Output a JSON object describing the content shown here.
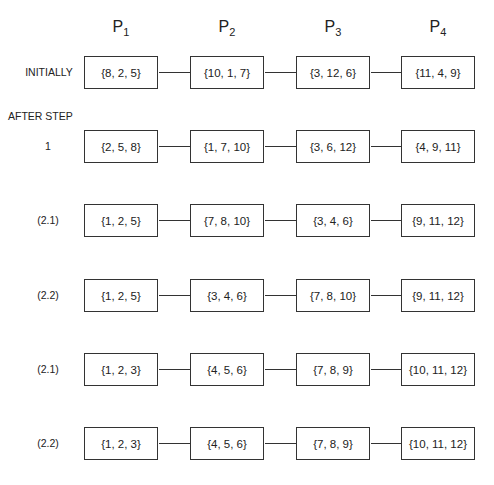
{
  "processors": [
    {
      "letter": "P",
      "sub": "1"
    },
    {
      "letter": "P",
      "sub": "2"
    },
    {
      "letter": "P",
      "sub": "3"
    },
    {
      "letter": "P",
      "sub": "4"
    }
  ],
  "after_step_label": "AFTER STEP",
  "rows": [
    {
      "label": "INITIALLY",
      "sets": [
        "{8, 2, 5}",
        "{10, 1, 7}",
        "{3, 12, 6}",
        "{11, 4, 9}"
      ]
    },
    {
      "label": "1",
      "sets": [
        "{2, 5, 8}",
        "{1, 7, 10}",
        "{3, 6, 12}",
        "{4, 9, 11}"
      ]
    },
    {
      "label": "(2.1)",
      "sets": [
        "{1, 2, 5}",
        "{7, 8, 10}",
        "{3, 4, 6}",
        "{9, 11, 12}"
      ]
    },
    {
      "label": "(2.2)",
      "sets": [
        "{1, 2, 5}",
        "{3, 4, 6}",
        "{7, 8, 10}",
        "{9, 11, 12}"
      ]
    },
    {
      "label": "(2.1)",
      "sets": [
        "{1, 2, 3}",
        "{4, 5, 6}",
        "{7, 8, 9}",
        "{10, 11, 12}"
      ]
    },
    {
      "label": "(2.2)",
      "sets": [
        "{1, 2, 3}",
        "{4, 5, 6}",
        "{7, 8, 9}",
        "{10, 11, 12}"
      ]
    }
  ]
}
